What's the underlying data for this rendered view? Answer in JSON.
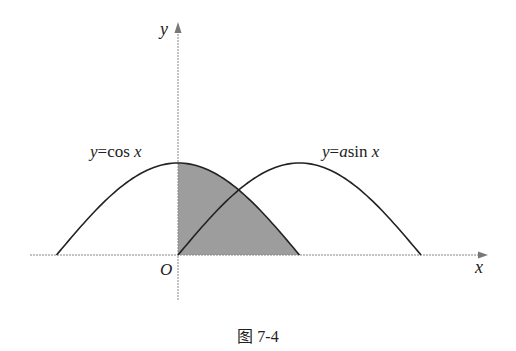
{
  "figure": {
    "caption": "图 7-4",
    "axes": {
      "x_label": "x",
      "y_label": "y",
      "origin_label": "O",
      "style": "dashed",
      "color": "#888888"
    },
    "curves": [
      {
        "name": "cos",
        "label_prefix": "y",
        "label_eq": "=cos ",
        "label_var": "x",
        "domain": "[-π/2, π/2]",
        "color": "#222222"
      },
      {
        "name": "asin",
        "label_prefix": "y",
        "label_eq": "=",
        "label_coef": "a",
        "label_fn": "sin ",
        "label_var": "x",
        "domain": "[0, π]",
        "color": "#222222"
      }
    ],
    "shaded_region": {
      "description": "region under y=cos x from x=0 to x=π/2",
      "color": "#8c8c8c"
    },
    "geometry": {
      "origin_px": [
        178,
        255
      ],
      "half_period_px": 121.5,
      "amplitude_px": 92
    }
  }
}
